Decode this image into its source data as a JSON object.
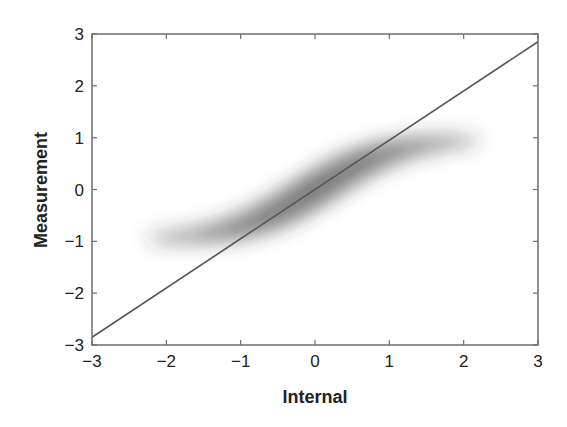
{
  "chart_data": {
    "type": "scatter",
    "title": "",
    "xlabel": "Internal",
    "ylabel": "Measurement",
    "xlim": [
      -3,
      3
    ],
    "ylim": [
      -3,
      3
    ],
    "xticks": [
      -3,
      -2,
      -1,
      0,
      1,
      2,
      3
    ],
    "yticks": [
      -3,
      -2,
      -1,
      0,
      1,
      2,
      3
    ],
    "xtick_labels": [
      "−3",
      "−2",
      "−1",
      "0",
      "1",
      "2",
      "3"
    ],
    "ytick_labels": [
      "−3",
      "−2",
      "−1",
      "0",
      "1",
      "2",
      "3"
    ],
    "grid": false,
    "legend": null,
    "series": [
      {
        "name": "density cloud",
        "kind": "density",
        "description": "S-shaped (sigmoid) point-density cloud, gray shading, darkest near origin",
        "color": "#555555",
        "x": [
          -2.2,
          -2.0,
          -1.5,
          -1.0,
          -0.5,
          0.0,
          0.5,
          1.0,
          1.5,
          2.0,
          2.2
        ],
        "y": [
          -0.97,
          -0.96,
          -0.9,
          -0.76,
          -0.46,
          0.0,
          0.46,
          0.76,
          0.9,
          0.96,
          0.97
        ]
      },
      {
        "name": "reference line",
        "kind": "line",
        "color": "#555555",
        "x": [
          -3,
          3
        ],
        "y": [
          -2.85,
          2.85
        ]
      }
    ]
  }
}
